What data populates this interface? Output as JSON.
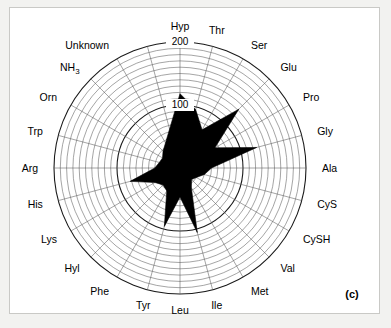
{
  "figure": {
    "panel_caption": "(c)",
    "background_color": "#f2f2f0",
    "plot_background_color": "#ffffff",
    "data_fill_color": "#000000",
    "grid_color": "#5a5a5a"
  },
  "chart_data": {
    "type": "radar",
    "title": "",
    "subtitle": "",
    "xlabel": "",
    "ylabel": "",
    "grid": true,
    "legend_position": "none",
    "rlim": [
      0,
      200
    ],
    "radial_tick_labels": [
      "100",
      "200"
    ],
    "radial_ticks": [
      100,
      200
    ],
    "radial_minor_ring_count": 20,
    "radial_tick_label_axis": "Hyp",
    "start_angle_deg": 90,
    "direction": "clockwise",
    "angle_step_deg": 15,
    "categories": [
      "Hyp",
      "Thr",
      "Ser",
      "Glu",
      "Pro",
      "Gly",
      "Ala",
      "CyS",
      "CySH",
      "Val",
      "Met",
      "Ile",
      "Leu",
      "Tyr",
      "Phe",
      "Hyl",
      "Lys",
      "His",
      "Arg",
      "Trp",
      "Orn",
      "NH3",
      "Unknown"
    ],
    "category_display": [
      "Hyp",
      "Thr",
      "Ser",
      "Glu",
      "Pro",
      "Gly",
      "Ala",
      "CyS",
      "CySH",
      "Val",
      "Met",
      "Ile",
      "Leu",
      "Tyr",
      "Phe",
      "Hyl",
      "Lys",
      "His",
      "Arg",
      "Trp",
      "Orn",
      "NH₃",
      "Unknown"
    ],
    "series": [
      {
        "name": "amino acid profile",
        "values": [
          118,
          96,
          70,
          132,
          64,
          126,
          50,
          40,
          30,
          26,
          36,
          106,
          46,
          96,
          42,
          38,
          46,
          82,
          40,
          34,
          32,
          38,
          46
        ]
      }
    ]
  }
}
